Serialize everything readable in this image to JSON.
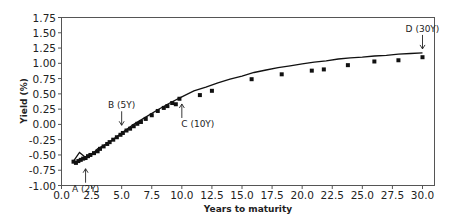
{
  "chart_data": {
    "type": "scatter",
    "title": "",
    "xlabel": "Years to maturity",
    "ylabel": "Yield (%)",
    "xlim": [
      0.0,
      31.0
    ],
    "ylim": [
      -1.0,
      1.75
    ],
    "xticks": [
      "0.0",
      "2.5",
      "5.0",
      "7.5",
      "10.0",
      "12.5",
      "15.0",
      "17.5",
      "20.0",
      "22.5",
      "25.0",
      "27.5",
      "30.0"
    ],
    "yticks": [
      "1.75",
      "1.50",
      "1.25",
      "1.00",
      "0.75",
      "0.50",
      "0.25",
      "0.00",
      "-0.25",
      "-0.50",
      "-0.75",
      "-1.00"
    ],
    "grid": false,
    "legend": null,
    "series": [
      {
        "name": "Observed yields",
        "style": "square markers",
        "color": "#111111",
        "x": [
          1.0,
          1.2,
          1.4,
          1.6,
          1.8,
          2.0,
          2.2,
          2.4,
          2.7,
          3.0,
          3.2,
          3.5,
          3.8,
          4.0,
          4.3,
          4.6,
          4.9,
          5.1,
          5.4,
          5.7,
          6.0,
          6.3,
          6.6,
          7.0,
          7.5,
          8.0,
          8.5,
          8.8,
          9.2,
          9.5,
          9.8,
          11.5,
          12.5,
          15.8,
          18.3,
          20.8,
          21.8,
          23.8,
          26.0,
          28.0,
          30.0
        ],
        "y": [
          -0.61,
          -0.63,
          -0.6,
          -0.58,
          -0.56,
          -0.55,
          -0.52,
          -0.5,
          -0.47,
          -0.44,
          -0.4,
          -0.36,
          -0.32,
          -0.29,
          -0.25,
          -0.21,
          -0.17,
          -0.14,
          -0.1,
          -0.07,
          -0.03,
          0.01,
          0.04,
          0.09,
          0.15,
          0.22,
          0.27,
          0.3,
          0.35,
          0.33,
          0.42,
          0.48,
          0.55,
          0.74,
          0.82,
          0.88,
          0.9,
          0.97,
          1.03,
          1.05,
          1.1
        ]
      },
      {
        "name": "Fitted curve",
        "style": "line",
        "color": "#111111",
        "x": [
          1.0,
          1.5,
          2.0,
          2.5,
          3.0,
          4.0,
          5.0,
          6.0,
          7.0,
          8.0,
          9.0,
          10.0,
          11.0,
          12.0,
          13.0,
          14.0,
          15.0,
          16.0,
          17.0,
          18.0,
          19.0,
          20.0,
          21.0,
          22.0,
          23.0,
          24.0,
          25.0,
          26.0,
          27.0,
          28.0,
          29.0,
          30.0
        ],
        "y": [
          -0.6,
          -0.46,
          -0.54,
          -0.5,
          -0.4,
          -0.29,
          -0.14,
          0.0,
          0.12,
          0.24,
          0.35,
          0.45,
          0.55,
          0.61,
          0.68,
          0.74,
          0.79,
          0.85,
          0.89,
          0.93,
          0.96,
          0.99,
          1.02,
          1.04,
          1.07,
          1.09,
          1.1,
          1.12,
          1.13,
          1.15,
          1.16,
          1.17
        ]
      }
    ],
    "annotations": [
      {
        "label": "A (2Y)",
        "x": 2.0,
        "y": -0.66,
        "arrow": "up"
      },
      {
        "label": "B (5Y)",
        "x": 5.0,
        "y": -0.08,
        "arrow": "down"
      },
      {
        "label": "C (10Y)",
        "x": 10.0,
        "y": 0.4,
        "arrow": "up"
      },
      {
        "label": "D (30Y)",
        "x": 30.0,
        "y": 1.17,
        "arrow": "down"
      }
    ]
  }
}
